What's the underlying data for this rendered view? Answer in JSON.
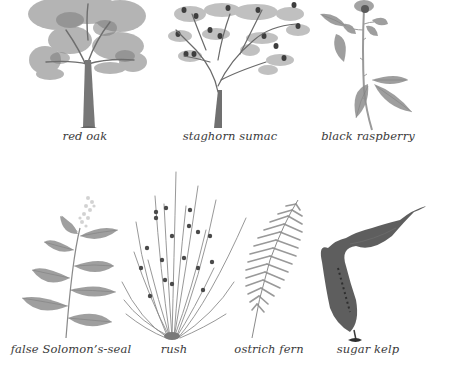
{
  "plate": {
    "background": "#ffffff",
    "caption_color": "#3a3a3a",
    "rows": [
      {
        "specimens": [
          {
            "id": "red-oak",
            "label": "red oak",
            "illustration": "tree-icon"
          },
          {
            "id": "staghorn-sumac",
            "label": "staghorn sumac",
            "illustration": "tree-with-fruit-icon"
          },
          {
            "id": "black-raspberry",
            "label": "black raspberry",
            "illustration": "bramble-stem-icon"
          }
        ]
      },
      {
        "specimens": [
          {
            "id": "false-solomons-seal",
            "label": "false Solomon’s-seal",
            "illustration": "leafy-stem-icon"
          },
          {
            "id": "rush",
            "label": "rush",
            "illustration": "grass-clump-icon"
          },
          {
            "id": "ostrich-fern",
            "label": "ostrich fern",
            "illustration": "fern-frond-icon"
          },
          {
            "id": "sugar-kelp",
            "label": "sugar kelp",
            "illustration": "kelp-blade-icon"
          }
        ]
      }
    ]
  }
}
